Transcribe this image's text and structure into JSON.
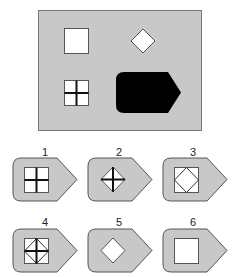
{
  "puzzle": {
    "panel": {
      "background": "#c8c8c8",
      "border": "#777777",
      "items": [
        {
          "id": "square",
          "description": "white square"
        },
        {
          "id": "diamond",
          "description": "white diamond"
        },
        {
          "id": "square-cross",
          "description": "white square with black cross"
        },
        {
          "id": "tag",
          "description": "black pentagon tag shape (missing-answer slot)"
        }
      ]
    },
    "options": [
      {
        "label": "1",
        "content": "square with cross"
      },
      {
        "label": "2",
        "content": "diamond with cross"
      },
      {
        "label": "3",
        "content": "square with inscribed diamond"
      },
      {
        "label": "4",
        "content": "square with inscribed diamond and cross"
      },
      {
        "label": "5",
        "content": "diamond"
      },
      {
        "label": "6",
        "content": "square"
      }
    ],
    "colors": {
      "tag_fill": "#c8c8c8",
      "tag_stroke": "#555555",
      "shape_fill": "#ffffff",
      "line": "#111111",
      "answer_slot": "#000000"
    }
  }
}
